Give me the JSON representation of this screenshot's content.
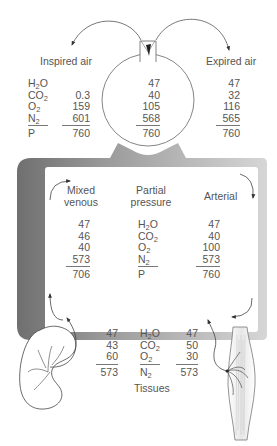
{
  "labels": {
    "inspired_air": "Inspired air",
    "expired_air": "Expired air",
    "mixed_venous": [
      "Mixed",
      "venous"
    ],
    "partial_pressure": [
      "Partial",
      "pressure"
    ],
    "arterial": "Arterial",
    "tissues": "Tissues"
  },
  "gas_labels": {
    "top": [
      {
        "base": "H",
        "sub": "2",
        "tail": "O"
      },
      {
        "base": "CO",
        "sub": "2",
        "tail": ""
      },
      {
        "base": "O",
        "sub": "2",
        "tail": ""
      },
      {
        "base": "N",
        "sub": "2",
        "tail": ""
      },
      {
        "base": "P",
        "sub": "",
        "tail": ""
      }
    ],
    "tissues": [
      {
        "base": "H",
        "sub": "2",
        "tail": "O"
      },
      {
        "base": "CO",
        "sub": "2",
        "tail": ""
      },
      {
        "base": "O",
        "sub": "2",
        "tail": ""
      },
      {
        "base": "N",
        "sub": "2",
        "tail": ""
      }
    ]
  },
  "inspired_air": {
    "H2O": "",
    "CO2": "0.3",
    "O2": "159",
    "N2": "601",
    "P": "760"
  },
  "alveolar": {
    "H2O": "47",
    "CO2": "40",
    "O2": "105",
    "N2": "568",
    "P": "760"
  },
  "expired_air": {
    "H2O": "47",
    "CO2": "32",
    "O2": "116",
    "N2": "565",
    "P": "760"
  },
  "mixed_venous": {
    "H2O": "47",
    "CO2": "46",
    "O2": "40",
    "N2": "573",
    "P": "706"
  },
  "arterial": {
    "H2O": "47",
    "CO2": "40",
    "O2": "100",
    "N2": "573",
    "P": "760"
  },
  "tissues_left": {
    "H2O": "47",
    "CO2": "43",
    "O2": "60",
    "N2": "573"
  },
  "tissues_right": {
    "H2O": "47",
    "CO2": "50",
    "O2": "30",
    "N2": "573"
  },
  "colors": {
    "frame_dark": "#6f6f6f",
    "frame_light": "#d6d6d6",
    "line": "#555555",
    "text": "#555555"
  }
}
